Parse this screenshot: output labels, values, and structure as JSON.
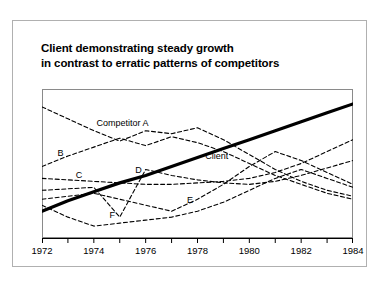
{
  "title": {
    "line1": "Client demonstrating steady growth",
    "line2": "in contrast to erratic patterns of competitors"
  },
  "labels": {
    "competitor_a": "Competitor A",
    "b": "B",
    "c": "C",
    "d": "D",
    "client": "Client",
    "e": "E",
    "f": "F"
  },
  "chart_data": {
    "type": "line",
    "title": "Client demonstrating steady growth in contrast to erratic patterns of competitors",
    "xlabel": "",
    "ylabel": "",
    "xlim": [
      1972,
      1984
    ],
    "ylim": [
      0,
      100
    ],
    "grid": false,
    "legend": "inline-annotations",
    "x": [
      1972,
      1973,
      1974,
      1975,
      1976,
      1977,
      1978,
      1979,
      1980,
      1981,
      1982,
      1983,
      1984
    ],
    "tick_labels": [
      "1972",
      "1974",
      "1976",
      "1978",
      "1980",
      "1982",
      "1984"
    ],
    "tick_values": [
      1972,
      1974,
      1976,
      1978,
      1980,
      1982,
      1984
    ],
    "minor_tick_values": [
      1973,
      1975,
      1977,
      1979,
      1981,
      1983
    ],
    "series": [
      {
        "name": "Client",
        "style": "solid",
        "width": 3.2,
        "color": "#000000",
        "values": [
          18,
          25,
          31,
          37,
          42,
          48,
          54,
          60,
          66,
          72,
          78,
          84,
          90
        ]
      },
      {
        "name": "Competitor A",
        "style": "dashed",
        "width": 1.1,
        "color": "#000000",
        "values": [
          88,
          80,
          72,
          65,
          72,
          70,
          74,
          66,
          56,
          46,
          38,
          32,
          28
        ]
      },
      {
        "name": "B",
        "style": "dashed",
        "width": 1.1,
        "color": "#000000",
        "values": [
          48,
          55,
          61,
          67,
          62,
          68,
          64,
          58,
          50,
          42,
          36,
          30,
          26
        ]
      },
      {
        "name": "C",
        "style": "dashed",
        "width": 1.1,
        "color": "#000000",
        "values": [
          40,
          39,
          38,
          37,
          36,
          36,
          37,
          38,
          40,
          44,
          50,
          58,
          66
        ]
      },
      {
        "name": "D",
        "style": "dashed",
        "width": 1.1,
        "color": "#000000",
        "values": [
          32,
          33,
          34,
          14,
          46,
          42,
          39,
          37,
          36,
          38,
          42,
          47,
          52
        ]
      },
      {
        "name": "E",
        "style": "dashed",
        "width": 1.1,
        "color": "#000000",
        "values": [
          26,
          28,
          30,
          26,
          22,
          18,
          26,
          36,
          48,
          58,
          52,
          44,
          36
        ]
      },
      {
        "name": "F",
        "style": "dashed",
        "width": 1.1,
        "color": "#000000",
        "values": [
          22,
          14,
          8,
          10,
          12,
          14,
          18,
          24,
          32,
          40,
          46,
          40,
          34
        ]
      }
    ],
    "annotations": [
      {
        "text": "Competitor A",
        "x": 1974.1,
        "y": 76
      },
      {
        "text": "B",
        "x": 1972.6,
        "y": 56
      },
      {
        "text": "C",
        "x": 1973.3,
        "y": 41
      },
      {
        "text": "D",
        "x": 1975.6,
        "y": 44
      },
      {
        "text": "Client",
        "x": 1978.3,
        "y": 54
      },
      {
        "text": "E",
        "x": 1977.6,
        "y": 24
      },
      {
        "text": "F",
        "x": 1974.6,
        "y": 14
      }
    ]
  }
}
